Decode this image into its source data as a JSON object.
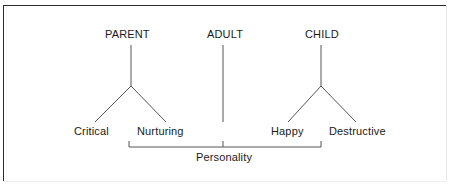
{
  "diagram": {
    "title_text_present": false,
    "line_color": "#555555",
    "text_color": "#1a1a1a",
    "border_color": "#2b2b2b",
    "background": "#ffffff",
    "ego_states": [
      {
        "id": "parent",
        "label": "PARENT",
        "children": [
          {
            "id": "critical",
            "label": "Critical"
          },
          {
            "id": "nurturing",
            "label": "Nurturing"
          }
        ]
      },
      {
        "id": "adult",
        "label": "ADULT",
        "children": []
      },
      {
        "id": "child",
        "label": "CHILD",
        "children": [
          {
            "id": "happy",
            "label": "Happy"
          },
          {
            "id": "destructive",
            "label": "Destructive"
          }
        ]
      }
    ],
    "grouping": {
      "label": "Personality",
      "spans": [
        "Nurturing",
        "Adult",
        "Happy"
      ]
    }
  }
}
